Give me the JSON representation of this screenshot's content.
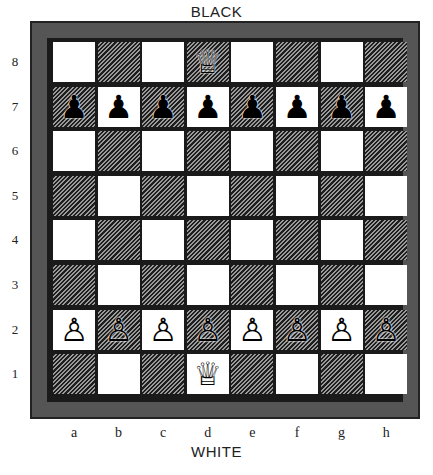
{
  "labels": {
    "top": "BLACK",
    "bottom": "WHITE"
  },
  "files": [
    "a",
    "b",
    "c",
    "d",
    "e",
    "f",
    "g",
    "h"
  ],
  "ranks": [
    "8",
    "7",
    "6",
    "5",
    "4",
    "3",
    "2",
    "1"
  ],
  "colors": {
    "frame": "#555555",
    "border": "#1a1a1a",
    "light_square": "#ffffff",
    "dark_square_hatch": "#1e1e1e"
  },
  "pieces": [
    {
      "square": "d8",
      "type": "queen",
      "color": "black",
      "glyph": "♕"
    },
    {
      "square": "a7",
      "type": "pawn",
      "color": "black",
      "glyph": "♟"
    },
    {
      "square": "b7",
      "type": "pawn",
      "color": "black",
      "glyph": "♟"
    },
    {
      "square": "c7",
      "type": "pawn",
      "color": "black",
      "glyph": "♟"
    },
    {
      "square": "d7",
      "type": "pawn",
      "color": "black",
      "glyph": "♟"
    },
    {
      "square": "e7",
      "type": "pawn",
      "color": "black",
      "glyph": "♟"
    },
    {
      "square": "f7",
      "type": "pawn",
      "color": "black",
      "glyph": "♟"
    },
    {
      "square": "g7",
      "type": "pawn",
      "color": "black",
      "glyph": "♟"
    },
    {
      "square": "h7",
      "type": "pawn",
      "color": "black",
      "glyph": "♟"
    },
    {
      "square": "a2",
      "type": "pawn",
      "color": "white",
      "glyph": "♙"
    },
    {
      "square": "b2",
      "type": "pawn",
      "color": "white",
      "glyph": "♙"
    },
    {
      "square": "c2",
      "type": "pawn",
      "color": "white",
      "glyph": "♙"
    },
    {
      "square": "d2",
      "type": "pawn",
      "color": "white",
      "glyph": "♙"
    },
    {
      "square": "e2",
      "type": "pawn",
      "color": "white",
      "glyph": "♙"
    },
    {
      "square": "f2",
      "type": "pawn",
      "color": "white",
      "glyph": "♙"
    },
    {
      "square": "g2",
      "type": "pawn",
      "color": "white",
      "glyph": "♙"
    },
    {
      "square": "h2",
      "type": "pawn",
      "color": "white",
      "glyph": "♙"
    },
    {
      "square": "d1",
      "type": "queen",
      "color": "white",
      "glyph": "♕"
    }
  ]
}
